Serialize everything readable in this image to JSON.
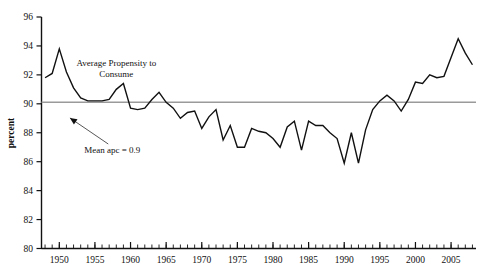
{
  "chart_data": {
    "type": "line",
    "title": "",
    "xlabel": "",
    "ylabel": "percent",
    "xlim": [
      1947.5,
      2008.5
    ],
    "ylim": [
      80,
      96
    ],
    "grid": false,
    "legend": "none",
    "y_ticks": [
      80,
      82,
      84,
      86,
      88,
      90,
      92,
      94,
      96
    ],
    "y_tick_labels": [
      "80",
      "82",
      "84",
      "86",
      "88",
      "90",
      "92",
      "94",
      "96"
    ],
    "x_ticks": [
      1950,
      1955,
      1960,
      1965,
      1970,
      1975,
      1980,
      1985,
      1990,
      1995,
      2000,
      2005
    ],
    "x_tick_labels": [
      "1950",
      "1955",
      "1960",
      "1965",
      "1970",
      "1975",
      "1980",
      "1985",
      "1990",
      "1995",
      "2000",
      "2005"
    ],
    "x_minor_tick_step": 1,
    "series": [
      {
        "name": "Average Propensity to Consume",
        "color": "#111111",
        "x": [
          1948,
          1949,
          1950,
          1951,
          1952,
          1953,
          1954,
          1955,
          1956,
          1957,
          1958,
          1959,
          1960,
          1961,
          1962,
          1963,
          1964,
          1965,
          1966,
          1967,
          1968,
          1969,
          1970,
          1971,
          1972,
          1973,
          1974,
          1975,
          1976,
          1977,
          1978,
          1979,
          1980,
          1981,
          1982,
          1983,
          1984,
          1985,
          1986,
          1987,
          1988,
          1989,
          1990,
          1991,
          1992,
          1993,
          1994,
          1995,
          1996,
          1997,
          1998,
          1999,
          2000,
          2001,
          2002,
          2003,
          2004,
          2005,
          2006,
          2007,
          2008
        ],
        "y": [
          91.8,
          92.1,
          93.8,
          92.2,
          91.1,
          90.4,
          90.2,
          90.2,
          90.2,
          90.3,
          91.0,
          91.4,
          89.7,
          89.6,
          89.7,
          90.3,
          90.8,
          90.1,
          89.7,
          89.0,
          89.4,
          89.5,
          88.3,
          89.1,
          89.6,
          87.5,
          88.5,
          87.0,
          87.0,
          88.3,
          88.1,
          88.0,
          87.6,
          87.0,
          88.4,
          88.8,
          86.8,
          88.8,
          88.5,
          88.5,
          88.0,
          87.6,
          85.9,
          88.0,
          85.9,
          88.2,
          89.6,
          90.2,
          90.6,
          90.2,
          89.5,
          90.3,
          91.5,
          91.4,
          92.0,
          91.8,
          91.9,
          93.2,
          94.5,
          93.5,
          92.7
        ]
      },
      {
        "name": "Mean apc line",
        "color": "#9a9a9a",
        "value": 90.1
      }
    ],
    "annotations": [
      {
        "name": "series-label",
        "text_lines": [
          "Average Propensity to",
          "Consume"
        ],
        "x": 1958.0,
        "y": 92.6
      },
      {
        "name": "mean-label",
        "text": "Mean apc = 0.9",
        "x": 1953.5,
        "y": 86.6,
        "arrow_to_x": 1951.0,
        "arrow_to_y": 89.3
      }
    ]
  }
}
